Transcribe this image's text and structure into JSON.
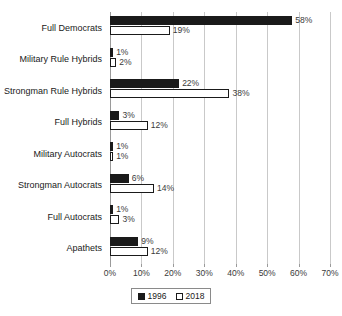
{
  "chart_data": {
    "type": "bar",
    "orientation": "horizontal",
    "title": "",
    "xlabel": "",
    "ylabel": "",
    "xlim": [
      0,
      70
    ],
    "xticks": [
      "0%",
      "10%",
      "20%",
      "30%",
      "40%",
      "50%",
      "60%",
      "70%"
    ],
    "xtick_values": [
      0,
      10,
      20,
      30,
      40,
      50,
      60,
      70
    ],
    "grid": true,
    "legend_position": "bottom-center",
    "value_suffix": "%",
    "categories": [
      "Full Democrats",
      "Military Rule Hybrids",
      "Strongman Rule Hybrids",
      "Full Hybrids",
      "Military Autocrats",
      "Strongman Autocrats",
      "Full Autocrats",
      "Apathets"
    ],
    "series": [
      {
        "name": "1996",
        "color": "#1a1a1a",
        "style": "filled",
        "values": [
          58,
          1,
          22,
          3,
          1,
          6,
          1,
          9
        ],
        "labels": [
          "58%",
          "1%",
          "22%",
          "3%",
          "1%",
          "6%",
          "1%",
          "9%"
        ]
      },
      {
        "name": "2018",
        "color": "#ffffff",
        "style": "hollow",
        "values": [
          19,
          2,
          38,
          12,
          1,
          14,
          3,
          12
        ],
        "labels": [
          "19%",
          "2%",
          "38%",
          "12%",
          "1%",
          "14%",
          "3%",
          "12%"
        ]
      }
    ]
  },
  "legend": {
    "entries": [
      {
        "label": "1996",
        "swatch": "filled-square"
      },
      {
        "label": "2018",
        "swatch": "hollow-square"
      }
    ]
  },
  "colors": {
    "series_1996": "#1a1a1a",
    "series_2018": "#ffffff",
    "gridline": "#c9c9c9",
    "axis": "#9a9a9a",
    "text": "#1a1a1a",
    "background": "#ffffff"
  }
}
